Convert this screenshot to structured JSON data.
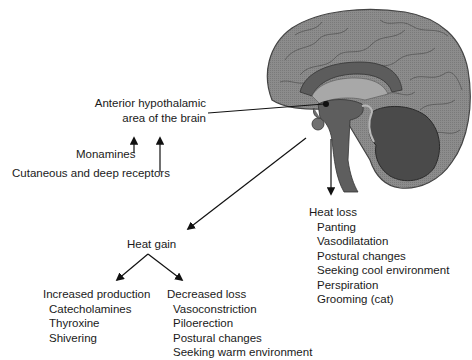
{
  "center": {
    "label_line1": "Anterior hypothalamic",
    "label_line2": "area of the brain"
  },
  "inputs": {
    "monamines": "Monamines",
    "receptors": "Cutaneous and deep receptors"
  },
  "heat_loss": {
    "heading": "Heat loss",
    "items": [
      "Panting",
      "Vasodilatation",
      "Postural changes",
      "Seeking cool environment",
      "Perspiration",
      "Grooming (cat)"
    ]
  },
  "heat_gain": {
    "heading": "Heat gain",
    "increased_production": {
      "heading": "Increased production",
      "items": [
        "Catecholamines",
        "Thyroxine",
        "Shivering"
      ]
    },
    "decreased_loss": {
      "heading": "Decreased loss",
      "items": [
        "Vasoconstriction",
        "Piloerection",
        "Postural changes",
        "Seeking warm environment"
      ]
    }
  },
  "colors": {
    "cortex": "#8a8a8a",
    "cortex_outline": "#555555",
    "deep": "#5e5e5e",
    "cerebellum": "#474747",
    "light": "#b0b0b0",
    "arrow": "#111111"
  }
}
